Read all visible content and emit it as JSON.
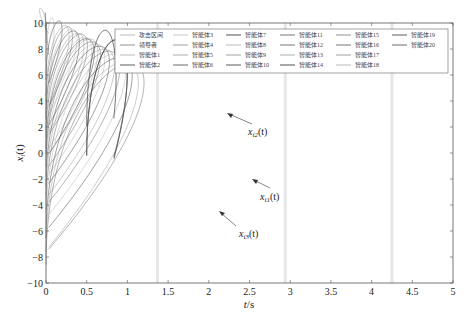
{
  "chart_data": {
    "type": "line",
    "title": "",
    "xlabel": "t/s",
    "ylabel": "x_i(t)",
    "xlim": [
      0,
      5
    ],
    "ylim": [
      -10,
      10
    ],
    "xticks": [
      "0",
      "0.5",
      "1",
      "1.5",
      "2",
      "2.5",
      "3",
      "3.5",
      "4",
      "4.5",
      "5"
    ],
    "yticks": [
      "-10",
      "-8",
      "-6",
      "-4",
      "-2",
      "0",
      "2",
      "4",
      "6",
      "8",
      "10"
    ],
    "grid": false,
    "legend_position": "upper right (inside, 6 columns)",
    "legend": [
      "攻击区间",
      "领导者",
      "智能体1",
      "智能体2",
      "智能体3",
      "智能体4",
      "智能体5",
      "智能体6",
      "智能体7",
      "智能体8",
      "智能体9",
      "智能体10",
      "智能体11",
      "智能体12",
      "智能体13",
      "智能体14",
      "智能体15",
      "智能体16",
      "智能体17",
      "智能体18",
      "智能体19",
      "智能体20"
    ],
    "attack_intervals_t": [
      1.37,
      2.94,
      4.25
    ],
    "series": [
      {
        "name": "x_i2(t)",
        "t": [
          0.5,
          1,
          1.5,
          2,
          2.5,
          3,
          3.5,
          4,
          4.5,
          5
        ],
        "values": [
          2.1,
          2.8,
          3.0,
          3.05,
          3.0,
          2.7,
          2.3,
          1.7,
          1.1,
          0.5
        ]
      },
      {
        "name": "x_i1(t)",
        "t": [
          0.5,
          1,
          1.5,
          2,
          2.5,
          3,
          3.5,
          4,
          4.5,
          5
        ],
        "values": [
          -0.2,
          -0.6,
          -1.0,
          -1.3,
          -1.6,
          -1.9,
          -2.0,
          -2.0,
          -1.8,
          -1.6
        ]
      },
      {
        "name": "x_i3(t)",
        "t": [
          0.5,
          1,
          1.5,
          2,
          2.5,
          3,
          3.5,
          4,
          4.5,
          5
        ],
        "values": [
          -0.2,
          -0.6,
          -2.0,
          -3.5,
          -4.9,
          -6.0,
          -6.8,
          -7.2,
          -7.2,
          -6.7
        ]
      }
    ],
    "annotations": [
      {
        "text": "x_i2(t)",
        "t": 2.0,
        "value": 3.05
      },
      {
        "text": "x_i1(t)",
        "t": 2.6,
        "value": -1.7
      },
      {
        "text": "x_i3(t)",
        "t": 1.9,
        "value": -3.3
      }
    ],
    "initial_range": [
      -10,
      10
    ]
  },
  "labels": {
    "xlabel_italic": "t",
    "xlabel_unit": "/s",
    "ylabel_main": "x",
    "ylabel_sub": "i",
    "ylabel_arg": "(t)",
    "ann_i2_main": "x",
    "ann_i2_sub": "i2",
    "ann_i1_main": "x",
    "ann_i1_sub": "i1",
    "ann_i3_main": "x",
    "ann_i3_sub": "i3",
    "arg": "(t)"
  }
}
